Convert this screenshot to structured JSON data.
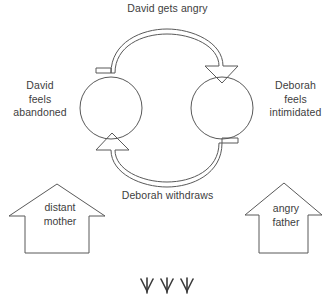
{
  "diagram": {
    "title_text_color": "#404040",
    "stroke_color": "#595959",
    "background": "#ffffff",
    "cycle": {
      "top_arrow_label": "David gets angry",
      "bottom_arrow_label": "Deborah withdraws",
      "left_node_label": "David\nfeels\nabandoned",
      "right_node_label": "Deborah\nfeels\nintimidated",
      "top_arrow_direction": "left-to-right",
      "bottom_arrow_direction": "right-to-left"
    },
    "origins": {
      "left_house_label": "distant\nmother",
      "right_house_label": "angry\nfather"
    },
    "footer": {
      "marks": "↓↓↓",
      "mark_count": 3,
      "mark_name": "down-arrow-mark"
    }
  }
}
